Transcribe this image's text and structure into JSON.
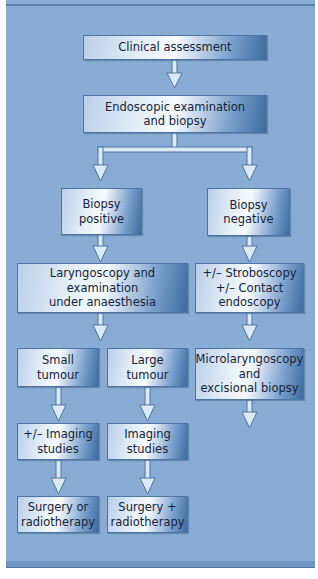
{
  "diagram": {
    "nodes": {
      "clinical_assessment": "Clinical assessment",
      "endoscopic_examination": "Endoscopic examination\nand biopsy",
      "biopsy_positive": "Biopsy\npositive",
      "biopsy_negative": "Biopsy\nnegative",
      "laryngoscopy": "Laryngoscopy and\nexamination\nunder anaesthesia",
      "stroboscopy": "+/– Stroboscopy\n+/– Contact\nendoscopy",
      "small_tumour": "Small\ntumour",
      "large_tumour": "Large\ntumour",
      "microlaryngoscopy": "Microlaryngoscopy\nand\nexcisional biopsy",
      "imaging_optional": "+/– Imaging\nstudies",
      "imaging": "Imaging\nstudies",
      "surgery_or_radio": "Surgery or\nradiotherapy",
      "surgery_plus_radio": "Surgery +\nradiotherapy"
    },
    "edges": [
      [
        "clinical_assessment",
        "endoscopic_examination"
      ],
      [
        "endoscopic_examination",
        "biopsy_positive"
      ],
      [
        "endoscopic_examination",
        "biopsy_negative"
      ],
      [
        "biopsy_positive",
        "laryngoscopy"
      ],
      [
        "biopsy_negative",
        "stroboscopy"
      ],
      [
        "laryngoscopy",
        "small_tumour"
      ],
      [
        "laryngoscopy",
        "large_tumour"
      ],
      [
        "stroboscopy",
        "microlaryngoscopy"
      ],
      [
        "small_tumour",
        "imaging_optional"
      ],
      [
        "large_tumour",
        "imaging"
      ],
      [
        "imaging_optional",
        "surgery_or_radio"
      ],
      [
        "imaging",
        "surgery_plus_radio"
      ]
    ],
    "colors": {
      "background": "#88acd3",
      "box_border": "#4e74a3",
      "arrow_fill": "#dbe9f7",
      "arrow_stroke": "#4e74a3"
    }
  }
}
